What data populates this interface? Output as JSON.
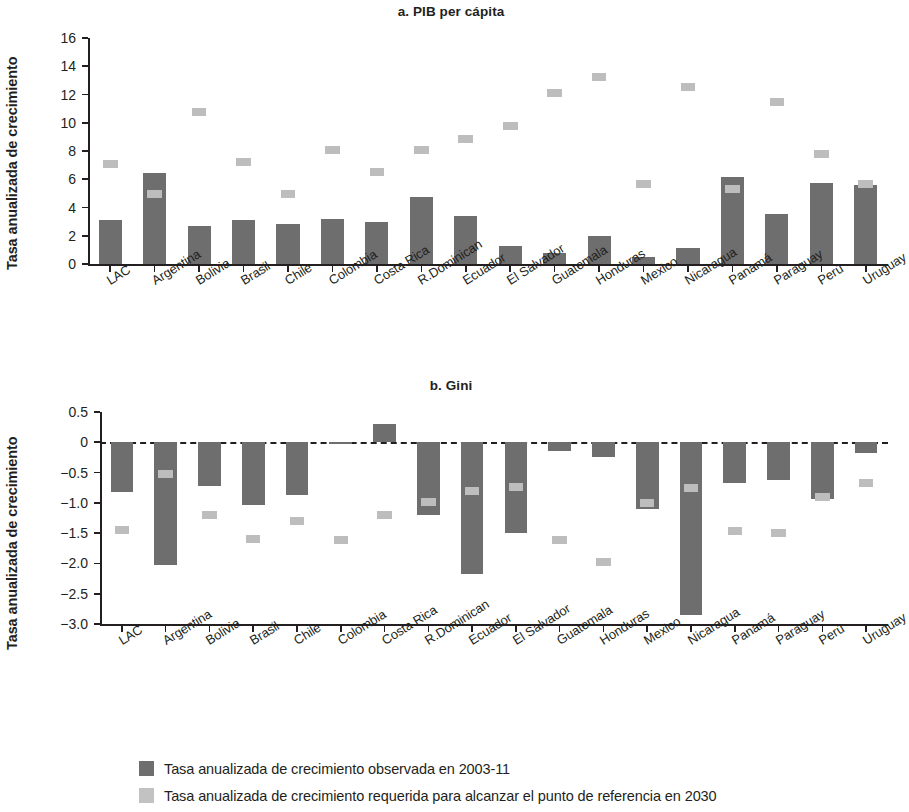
{
  "chart_data": [
    {
      "type": "bar",
      "panel": "a",
      "title": "a. PIB per cápita",
      "xlabel": "",
      "ylabel": "Tasa anualizada de crecimiento",
      "ylim": [
        0,
        16
      ],
      "yticks": [
        "0",
        "2",
        "4",
        "6",
        "8",
        "10",
        "12",
        "14",
        "16"
      ],
      "ytick_values": [
        0,
        2,
        4,
        6,
        8,
        10,
        12,
        14,
        16
      ],
      "grid": false,
      "legend_position": "bottom",
      "categories": [
        "LAC",
        "Argentina",
        "Bolivia",
        "Brasil",
        "Chile",
        "Colombia",
        "Costa Rica",
        "R.Dominican",
        "Ecuador",
        "El Salvador",
        "Guatemala",
        "Honduras",
        "Mexico",
        "Nicaragua",
        "Panamá",
        "Paraguay",
        "Perú",
        "Uruguay"
      ],
      "series": [
        {
          "name": "Tasa anualizada de crecimiento observada en 2003-11",
          "style": "bar",
          "color": "#6e6e6e",
          "values": [
            3.15,
            6.45,
            2.7,
            3.1,
            2.85,
            3.2,
            2.95,
            4.75,
            3.4,
            1.3,
            0.8,
            2.0,
            0.5,
            1.1,
            6.15,
            3.55,
            5.75,
            5.6
          ]
        },
        {
          "name": "Tasa anualizada de crecimiento requerida para alcanzar el punto de referencia en 2030",
          "style": "marker",
          "color": "#bdbdbd",
          "values": [
            7.1,
            4.95,
            10.75,
            7.2,
            4.95,
            8.05,
            6.5,
            8.1,
            8.85,
            9.75,
            12.1,
            13.25,
            5.65,
            12.5,
            5.3,
            11.45,
            7.8,
            5.65
          ]
        }
      ]
    },
    {
      "type": "bar",
      "panel": "b",
      "title": "b. Gini",
      "xlabel": "",
      "ylabel": "Tasa anualizada de crecimiento",
      "ylim": [
        -3.0,
        0.5
      ],
      "yticks": [
        "0.5",
        "0",
        "−0.5",
        "−1.0",
        "−1.5",
        "−2.0",
        "−2.5",
        "−3.0"
      ],
      "ytick_values": [
        0.5,
        0,
        -0.5,
        -1.0,
        -1.5,
        -2.0,
        -2.5,
        -3.0
      ],
      "grid": false,
      "zero_line": true,
      "legend_position": "bottom",
      "categories": [
        "LAC",
        "Argentina",
        "Bolivia",
        "Brasil",
        "Chile",
        "Colombia",
        "Costa Rica",
        "R.Dominican",
        "Ecuador",
        "El Salvador",
        "Guatemala",
        "Honduras",
        "Mexico",
        "Nicaragua",
        "Panamá",
        "Paraguay",
        "Perú",
        "Uruguay"
      ],
      "series": [
        {
          "name": "Tasa anualizada de crecimiento observada en 2003-11",
          "style": "bar",
          "color": "#6e6e6e",
          "values": [
            -0.82,
            -2.02,
            -0.72,
            -1.03,
            -0.87,
            -0.03,
            0.3,
            -1.2,
            -2.18,
            -1.5,
            -0.14,
            -0.25,
            -1.1,
            -2.85,
            -0.68,
            -0.62,
            -0.93,
            -0.17
          ]
        },
        {
          "name": "Tasa anualizada de crecimiento requerida para alcanzar el punto de referencia en 2030",
          "style": "marker",
          "color": "#bdbdbd",
          "values": [
            -1.45,
            -0.52,
            -1.2,
            -1.6,
            -1.3,
            -1.62,
            -1.2,
            -0.98,
            -0.8,
            -0.73,
            -1.62,
            -1.98,
            -1.0,
            -0.75,
            -1.47,
            -1.5,
            -0.9,
            -0.67
          ]
        }
      ]
    }
  ],
  "legend": {
    "items": [
      {
        "swatch": "observed",
        "label": "Tasa anualizada de crecimiento observada en 2003-11"
      },
      {
        "swatch": "required",
        "label": "Tasa anualizada de crecimiento requerida para alcanzar el punto de referencia en 2030"
      }
    ]
  },
  "colors": {
    "observed": "#6e6e6e",
    "required": "#bdbdbd",
    "axis": "#231f20",
    "background": "#ffffff"
  }
}
